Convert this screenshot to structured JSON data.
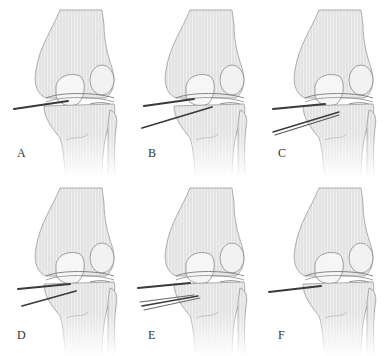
{
  "figure": {
    "colors": {
      "background": "#ffffff",
      "bone_fill": "#ececec",
      "bone_stroke": "#8a8a8a",
      "hatch": "#d0d0d0",
      "instrument": "#3a3a3a",
      "label": "#333333"
    },
    "panels": [
      {
        "id": "A",
        "label": "A",
        "instruments": 1
      },
      {
        "id": "B",
        "label": "B",
        "instruments": 2
      },
      {
        "id": "C",
        "label": "C",
        "instruments": 2
      },
      {
        "id": "D",
        "label": "D",
        "instruments": 2
      },
      {
        "id": "E",
        "label": "E",
        "instruments": 3
      },
      {
        "id": "F",
        "label": "F",
        "instruments": 1
      }
    ]
  }
}
